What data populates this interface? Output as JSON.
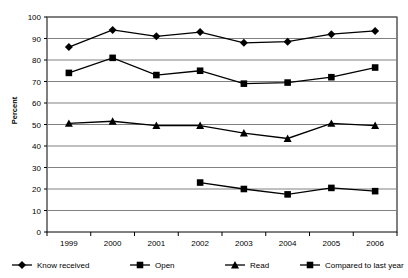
{
  "chart_data": {
    "type": "line",
    "title": "",
    "xlabel": "",
    "ylabel": "Percent",
    "categories": [
      "1999",
      "2000",
      "2001",
      "2002",
      "2003",
      "2004",
      "2005",
      "2006"
    ],
    "ylim": [
      0,
      100
    ],
    "ytick_step": 10,
    "yticks": [
      "0",
      "10",
      "20",
      "30",
      "40",
      "50",
      "60",
      "70",
      "80",
      "90",
      "100"
    ],
    "grid": true,
    "legend_position": "bottom",
    "series": [
      {
        "name": "Know received",
        "marker": "diamond",
        "color": "#000000",
        "values": [
          86,
          94,
          91,
          93,
          88,
          88.5,
          92,
          93.5
        ]
      },
      {
        "name": "Open",
        "marker": "square",
        "color": "#000000",
        "values": [
          74,
          81,
          73,
          75,
          69,
          69.5,
          72,
          76.5
        ]
      },
      {
        "name": "Read",
        "marker": "triangle",
        "color": "#000000",
        "values": [
          50.5,
          51.5,
          49.5,
          49.5,
          46,
          43.5,
          50.5,
          49.5
        ]
      },
      {
        "name": "Compared to last year",
        "marker": "square",
        "color": "#000000",
        "values": [
          null,
          null,
          null,
          23,
          20,
          17.5,
          20.5,
          19
        ]
      }
    ]
  },
  "legend": {
    "items": [
      {
        "label": "Know received",
        "marker": "diamond"
      },
      {
        "label": "Open",
        "marker": "square"
      },
      {
        "label": "Read",
        "marker": "triangle"
      },
      {
        "label": "Compared to last year",
        "marker": "square"
      }
    ]
  },
  "axes": {
    "y_title": "Percent"
  }
}
